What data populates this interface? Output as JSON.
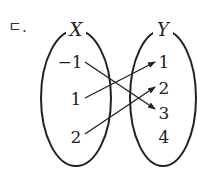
{
  "label": "ㄷ.",
  "sets": {
    "X": {
      "name": "X",
      "elements": [
        "−1",
        "1",
        "2"
      ]
    },
    "Y": {
      "name": "Y",
      "elements": [
        "1",
        "2",
        "3",
        "4"
      ]
    }
  },
  "mappings": [
    {
      "from": "−1",
      "to": "3"
    },
    {
      "from": "1",
      "to": "1"
    },
    {
      "from": "2",
      "to": "2"
    }
  ]
}
